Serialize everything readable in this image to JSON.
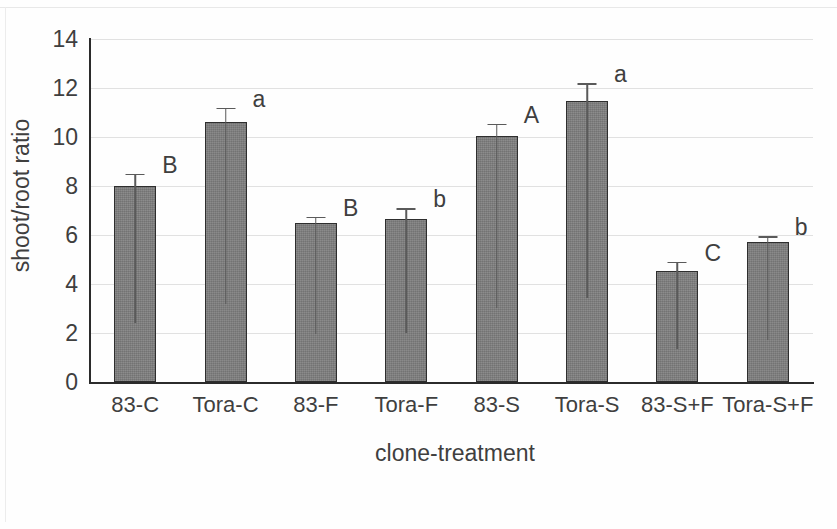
{
  "chart_data": {
    "type": "bar",
    "title": "",
    "xlabel": "clone-treatment",
    "ylabel": "shoot/root ratio",
    "categories": [
      "83-C",
      "Tora-C",
      "83-F",
      "Tora-F",
      "83-S",
      "Tora-S",
      "83-S+F",
      "Tora-S+F"
    ],
    "values": [
      8.0,
      10.6,
      6.5,
      6.65,
      10.05,
      11.45,
      4.55,
      5.7
    ],
    "errors": [
      0.5,
      0.6,
      0.25,
      0.45,
      0.5,
      0.75,
      0.35,
      0.25
    ],
    "point_labels": [
      "B",
      "a",
      "B",
      "b",
      "A",
      "a",
      "C",
      "b"
    ],
    "ylim": [
      0,
      14
    ],
    "yticks": [
      0,
      2,
      4,
      6,
      8,
      10,
      12,
      14
    ],
    "ytick_labels": [
      "0",
      "2",
      "4",
      "6",
      "8",
      "10",
      "12",
      "14"
    ],
    "grid": "horizontal",
    "legend": "none",
    "bar_color": "#7e7e7e",
    "bar_edge_color": "#2e2e2e",
    "axis_color": "#2b2b2b",
    "gridline_color": "#dcdcdc",
    "error_bar_color": "#5a5a5a"
  }
}
